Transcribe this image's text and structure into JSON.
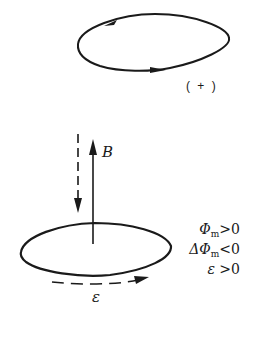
{
  "top_loop": {
    "sign_label": "( + )",
    "arrow_direction": "counterclockwise"
  },
  "field": {
    "label": "B",
    "solid_arrow": "up",
    "dashed_arrow": "down"
  },
  "bottom_loop": {
    "emf_label": "ε",
    "emf_arrow": "dashed, pointing right (front side)"
  },
  "conditions": [
    {
      "symbol": "Φ",
      "sub": "m",
      "relation": ">0"
    },
    {
      "symbol": "ΔΦ",
      "sub": "m",
      "relation": "<0"
    },
    {
      "symbol": "ε",
      "sub": "",
      "relation": " >0"
    }
  ],
  "colors": {
    "stroke": "#1a1a1a",
    "background": "#ffffff"
  }
}
